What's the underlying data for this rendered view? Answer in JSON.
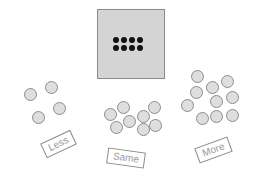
{
  "reference": {
    "dot_count": 8,
    "rows": 2,
    "cols": 4,
    "box_color": "#d4d4d4",
    "dot_color": "#111111"
  },
  "groups": [
    {
      "label": "Less",
      "count": 4,
      "circles": [
        [
          30,
          94
        ],
        [
          51,
          87
        ],
        [
          59,
          108
        ],
        [
          38,
          117
        ]
      ],
      "label_pos": [
        58,
        144
      ],
      "label_rotate": -25
    },
    {
      "label": "Same",
      "count": 8,
      "circles": [
        [
          110,
          114
        ],
        [
          123,
          107
        ],
        [
          154,
          107
        ],
        [
          143,
          116
        ],
        [
          129,
          121
        ],
        [
          116,
          127
        ],
        [
          143,
          129
        ],
        [
          155,
          125
        ]
      ],
      "label_pos": [
        126,
        158
      ],
      "label_rotate": 8
    },
    {
      "label": "More",
      "count": 10,
      "circles": [
        [
          197,
          76
        ],
        [
          227,
          81
        ],
        [
          212,
          87
        ],
        [
          196,
          92
        ],
        [
          216,
          101
        ],
        [
          232,
          97
        ],
        [
          187,
          105
        ],
        [
          202,
          118
        ],
        [
          216,
          116
        ],
        [
          232,
          115
        ]
      ],
      "label_pos": [
        213,
        150
      ],
      "label_rotate": -20
    }
  ],
  "circle_color": "#dedede"
}
